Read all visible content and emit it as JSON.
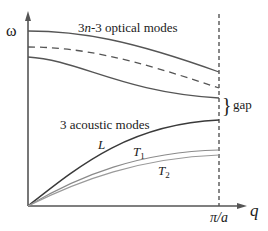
{
  "diagram": {
    "y_axis_label": "ω",
    "x_axis_label": "q",
    "zone_boundary_label": "π/a",
    "optical_label": {
      "prefix": "3",
      "n": "n",
      "suffix": "-3 optical modes"
    },
    "acoustic_label": "3 acoustic modes",
    "gap_label": "gap",
    "gap_brace": "}",
    "branch_labels": {
      "L": "L",
      "T1": "T",
      "T1_sub": "1",
      "T2": "T",
      "T2_sub": "2"
    },
    "colors": {
      "axis": "#555555",
      "optical": "#555555",
      "L": "#3a3a3a",
      "T": "#8a8a8a",
      "dashed_boundary": "#555555",
      "text": "#1a1a1a"
    }
  }
}
